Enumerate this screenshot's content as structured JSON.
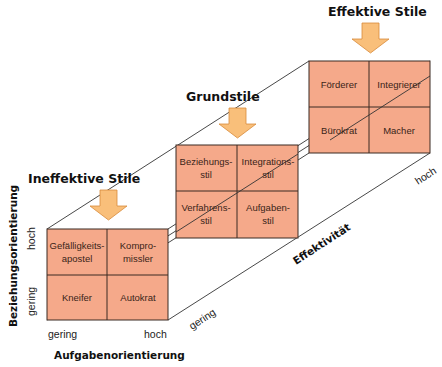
{
  "colors": {
    "cell_fill": "#f5a98a",
    "cell_border": "#3a2a22",
    "arrow_fill": "#f9bf7a",
    "arrow_stroke": "#d88a3a",
    "line": "#333333"
  },
  "boxes": {
    "ineffective": {
      "title": "Ineffektive Stile",
      "cells": {
        "top_left": [
          "Gefälligkeits-",
          "apostel"
        ],
        "top_right": [
          "Kompro-",
          "missler"
        ],
        "bottom_left": [
          "Kneifer"
        ],
        "bottom_right": [
          "Autokrat"
        ]
      }
    },
    "basic": {
      "title": "Grundstile",
      "cells": {
        "top_left": [
          "Beziehungs-",
          "stil"
        ],
        "top_right": [
          "Integrations-",
          "stil"
        ],
        "bottom_left": [
          "Verfahrens-",
          "stil"
        ],
        "bottom_right": [
          "Aufgaben-",
          "stil"
        ]
      }
    },
    "effective": {
      "title": "Effektive Stile",
      "cells": {
        "top_left": [
          "Förderer"
        ],
        "top_right": [
          "Integrierer"
        ],
        "bottom_left": [
          "Bürokrat"
        ],
        "bottom_right": [
          "Macher"
        ]
      }
    }
  },
  "axes": {
    "y": {
      "title": "Beziehungsorientierung",
      "low": "gering",
      "high": "hoch"
    },
    "x": {
      "title": "Aufgabenorientierung",
      "low": "gering",
      "high": "hoch"
    },
    "z": {
      "title": "Effektivität",
      "low": "gering",
      "high": "hoch"
    }
  }
}
